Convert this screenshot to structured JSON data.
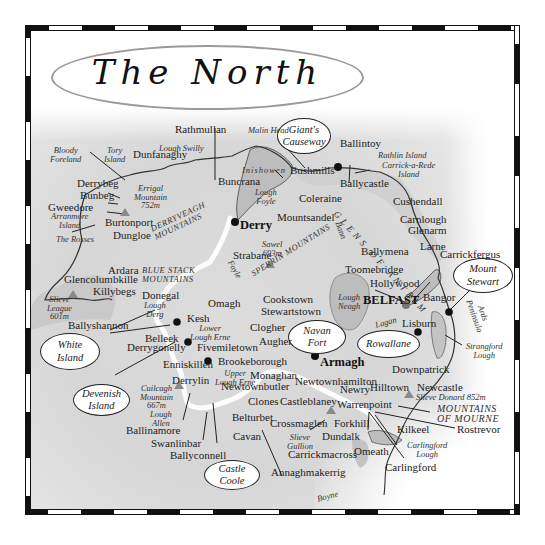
{
  "title": "The North",
  "callouts": {
    "giants_causeway": "Giant's\nCauseway",
    "mount_stewart": "Mount\nStewart",
    "navan_fort": "Navan\nFort",
    "rowallane": "Rowallane",
    "white_island": "White\nIsland",
    "devenish_island": "Devenish\nIsland",
    "castle_coole": "Castle\nCoole"
  },
  "towns": {
    "rathmullan": "Rathmullan",
    "dunfanaghy": "Dunfanaghy",
    "derrybeg": "Derrybeg",
    "bunbeg": "Bunbeg",
    "gweedore": "Gweedore",
    "burtonport": "Burtonport",
    "dungloe": "Dungloe",
    "buncrana": "Buncrana",
    "derry": "Derry",
    "bushmills": "Bushmills",
    "ballintoy": "Ballintoy",
    "ballycastle": "Ballycastle",
    "coleraine": "Coleraine",
    "mountsandel": "Mountsandel",
    "cushendall": "Cushendall",
    "carnlough": "Carnlough",
    "glenarm": "Glenarm",
    "larne": "Larne",
    "carrickfergus": "Carrickfergus",
    "ballymena": "Ballymena",
    "toomebridge": "Toomebridge",
    "hollywood": "Hollywood",
    "belfast": "BELFAST",
    "bangor": "Bangor",
    "lisburn": "Lisburn",
    "strabane": "Strabane",
    "ardara": "Ardara",
    "glencolumbkille": "Glencolumbkille",
    "killybegs": "Killybegs",
    "donegal": "Donegal",
    "omagh": "Omagh",
    "cookstown": "Cookstown",
    "stewartstown": "Stewartstown",
    "ballyshannon": "Ballyshannon",
    "kesh": "Kesh",
    "belleek": "Belleek",
    "derrygonelly": "Derrygonelly",
    "fivemiletown": "Fivemiletown",
    "clogher": "Clogher",
    "augher": "Augher",
    "armagh": "Armagh",
    "enniskillen": "Enniskillen",
    "brookeborough": "Brookeborough",
    "monaghan": "Monaghan",
    "newtownhamilton": "Newtownhamilton",
    "derrylin": "Derrylin",
    "newtownbutler": "Newtownbutler",
    "clones": "Clones",
    "castleblaney": "Castleblaney",
    "newry": "Newry",
    "hilltown": "Hilltown",
    "newcastle": "Newcastle",
    "downpatrick": "Downpatrick",
    "warrenpoint": "Warrenpoint",
    "belturbet": "Belturbet",
    "crossmaglen": "Crossmaglen",
    "forkhill": "Forkhill",
    "kilkeel": "Kilkeel",
    "rostrevor": "Rostrevor",
    "ballinamore": "Ballinamore",
    "swanlinbar": "Swanlinbar",
    "cavan": "Cavan",
    "dundalk": "Dundalk",
    "omeath": "Omeath",
    "carrickmacross": "Carrickmacross",
    "carlingford": "Carlingford",
    "ballyconnell": "Ballyconnell",
    "annaghmakerrig": "Annaghmakerrig"
  },
  "features": {
    "malin_head": "Malin Head",
    "lough_swilly": "Lough Swilly",
    "bloody_foreland": "Bloody\nForeland",
    "tory_island": "Tory\nIsland",
    "errigal": "Errigal\nMountain\n752m",
    "arranmore": "Arranmore\nIsland",
    "the_rosses": "The Rosses",
    "inishowen": "Inishowen",
    "lough_foyle": "Lough\nFoyle",
    "rathlin": "Rathlin Island",
    "carrick_a_rede": "Carrick-a-Rede\nIsland",
    "sawel": "Sawel\n693m",
    "bann": "Bann",
    "foyle": "Foyle",
    "slieve_league": "Slieve\nLeague\n601m",
    "lough_derg": "Lough\nDerg",
    "lough_neagh": "Lough\nNeagh",
    "lagan": "Lagan",
    "ards_peninsula": "Ards\nPeninsula",
    "strangford_lough": "Strangford\nLough",
    "lower_lough_erne": "Lower\nLough Erne",
    "upper_lough_erne": "Upper\nLough Erne",
    "cuilcagh": "Cuilcagh\nMountain\n667m",
    "lough_allen": "Lough\nAllen",
    "slieve_gullion": "Slieve\nGullion",
    "slieve_donard": "Slieve Donard 852m",
    "carlingford_lough": "Carlingford\nLough",
    "boyne": "Boyne"
  },
  "regions": {
    "derryveagh": "DERRYVEAGH\nMOUNTAINS",
    "blue_stack": "BLUE STACK\nMOUNTAINS",
    "sperrin": "SPERRIN MOUNTAINS",
    "glens_of_antrim": "GLENS OF ANTRIM",
    "mourne": "MOUNTAINS\nOF MOURNE"
  },
  "colors": {
    "land": "#d9d9d9",
    "lough": "#bdbdbd",
    "sea": "#ffffff",
    "border_line": "#ffffff",
    "mountain": "#8a8a8a",
    "frame": "#111111"
  }
}
